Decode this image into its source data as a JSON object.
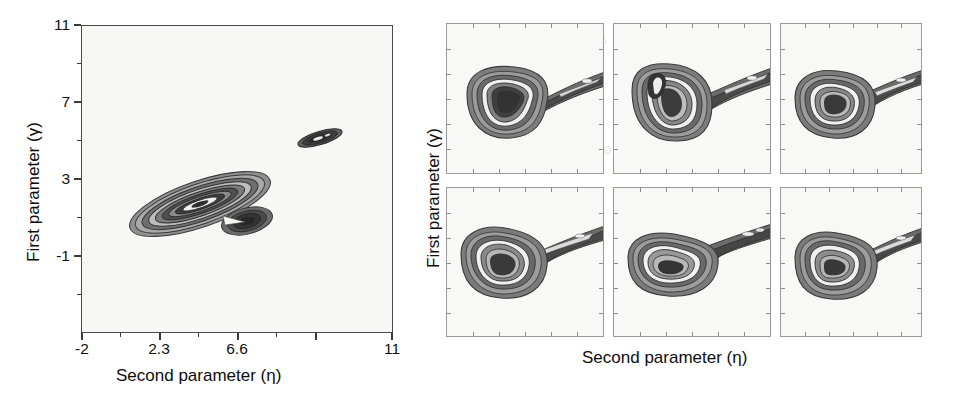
{
  "figure": {
    "background_color": "#ffffff",
    "ink_color": "#1a1a1a"
  },
  "main_plot": {
    "x_axis_title": "Second parameter (η)",
    "y_axis_title": "First parameter (γ)",
    "x_ticks": [
      "-2",
      "2.3",
      "6.6",
      "11"
    ],
    "y_ticks": [
      "11",
      "7",
      "3",
      "-1"
    ]
  },
  "grid_plots": {
    "x_axis_title": "Second parameter (η)",
    "y_axis_title": "First parameter (γ)",
    "rows": 2,
    "cols": 3,
    "panels": [
      {
        "id": "panel-1",
        "row": 1,
        "col": 1
      },
      {
        "id": "panel-2",
        "row": 1,
        "col": 2
      },
      {
        "id": "panel-3",
        "row": 1,
        "col": 3
      },
      {
        "id": "panel-4",
        "row": 2,
        "col": 1
      },
      {
        "id": "panel-5",
        "row": 2,
        "col": 2
      },
      {
        "id": "panel-6",
        "row": 2,
        "col": 3
      }
    ]
  },
  "ghost_text": [
    {
      "text": "of the posterior distribution",
      "x": 95,
      "y": 40,
      "size": 17
    },
    {
      "text": "are a difference of the calculated",
      "x": 95,
      "y": 72,
      "size": 17
    },
    {
      "text": "parameters. The method is",
      "x": 100,
      "y": 104,
      "size": 17
    },
    {
      "text": "ble, it is not pressing reasons",
      "x": 92,
      "y": 136,
      "size": 17
    },
    {
      "text": "the possibility of choosing",
      "x": 105,
      "y": 166,
      "size": 17
    },
    {
      "text": "a test of the interpolation",
      "x": 100,
      "y": 198,
      "size": 17
    },
    {
      "text": "more places of more accurate",
      "x": 95,
      "y": 230,
      "size": 17
    },
    {
      "text": "values for the parameters",
      "x": 100,
      "y": 262,
      "size": 17
    },
    {
      "text": "estimates by the procedure",
      "x": 100,
      "y": 292,
      "size": 17
    },
    {
      "text": "and the distributions",
      "x": 470,
      "y": 30,
      "size": 16
    },
    {
      "text": "the estimation of",
      "x": 650,
      "y": 22,
      "size": 16
    },
    {
      "text": "contours were",
      "x": 790,
      "y": 18,
      "size": 16
    },
    {
      "text": "to consider",
      "x": 800,
      "y": 50,
      "size": 16
    },
    {
      "text": "the distribution",
      "x": 470,
      "y": 78,
      "size": 16
    },
    {
      "text": "of multiple",
      "x": 690,
      "y": 78,
      "size": 16
    },
    {
      "text": "of multiple parameters",
      "x": 460,
      "y": 140,
      "size": 16
    },
    {
      "text": "a network",
      "x": 790,
      "y": 128,
      "size": 16
    },
    {
      "text": "for the equations",
      "x": 470,
      "y": 210,
      "size": 16
    },
    {
      "text": "values",
      "x": 690,
      "y": 198,
      "size": 16
    },
    {
      "text": "are 180",
      "x": 855,
      "y": 250,
      "size": 16
    }
  ]
}
